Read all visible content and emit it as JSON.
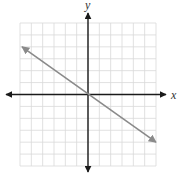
{
  "chart_data": {
    "type": "line",
    "title": "",
    "xlabel": "x",
    "ylabel": "y",
    "xlim": [
      -6,
      6
    ],
    "ylim": [
      -6,
      6
    ],
    "grid": true,
    "grid_step": 1,
    "ticks_labeled": false,
    "legend": null,
    "series": [
      {
        "name": "line",
        "kind": "line-with-arrows",
        "x": [
          -6,
          0,
          6
        ],
        "y": [
          4,
          0,
          -4
        ],
        "slope": -0.6667,
        "intercept": 0
      }
    ]
  },
  "colors": {
    "grid": "#d9d9d9",
    "axes": "#1a1a1a",
    "line": "#8a8a8a",
    "background": "#ffffff"
  },
  "labels": {
    "x": "x",
    "y": "y"
  }
}
